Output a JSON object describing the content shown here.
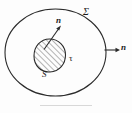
{
  "figure": {
    "background_color": "#fdfdfd",
    "stroke_color": "#2b2b2b",
    "hatch_color": "#555555",
    "labels": {
      "outer_surface": "Σ",
      "normal_inner": "n",
      "normal_outer": "n",
      "volume": "τ",
      "inner_surface": "S"
    },
    "geometry": {
      "outer_ellipse": {
        "cx": 55.5,
        "cy": 52.5,
        "rx": 50.5,
        "ry": 43.5
      },
      "inner_blob": {
        "cx": 49.5,
        "cy": 55.5,
        "rx": 15.5,
        "ry": 16.5
      },
      "arrow_inner": {
        "x1": 44,
        "y1": 50,
        "x2": 61,
        "y2": 26
      },
      "arrow_outer": {
        "x1": 104,
        "y1": 50,
        "x2": 120,
        "y2": 50
      }
    }
  }
}
